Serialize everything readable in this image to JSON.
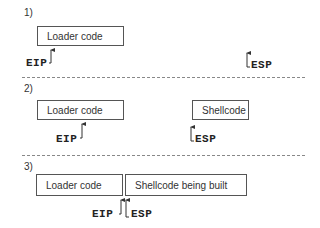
{
  "steps": [
    {
      "label": "1)",
      "boxes": [
        {
          "text": "Loader code"
        }
      ],
      "pointers": [
        {
          "name": "EIP"
        },
        {
          "name": "ESP"
        }
      ]
    },
    {
      "label": "2)",
      "boxes": [
        {
          "text": "Loader code"
        },
        {
          "text": "Shellcode"
        }
      ],
      "pointers": [
        {
          "name": "EIP"
        },
        {
          "name": "ESP"
        }
      ]
    },
    {
      "label": "3)",
      "boxes": [
        {
          "text": "Loader code"
        },
        {
          "text": "Shellcode being built"
        }
      ],
      "pointers": [
        {
          "name": "EIP"
        },
        {
          "name": "ESP"
        }
      ]
    }
  ]
}
